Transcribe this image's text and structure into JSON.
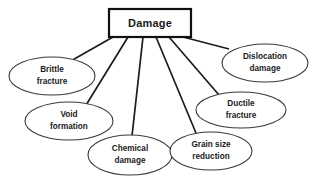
{
  "diagram": {
    "type": "radial-tree",
    "title": "Damage",
    "canvas": {
      "width": 316,
      "height": 182,
      "background": "#ffffff"
    },
    "colors": {
      "root_border": "#111111",
      "leaf_border": "#3a3a3a",
      "connector": "#1c1c1c",
      "text": "#1a1a1a",
      "fill": "#ffffff"
    },
    "root": {
      "label": "Damage",
      "shape": "rectangle",
      "x": 109,
      "y": 9,
      "width": 82,
      "height": 28
    },
    "leaves": [
      {
        "id": "brittle-fracture",
        "line1": "Brittle",
        "line2": "fracture",
        "shape": "ellipse",
        "cx": 52,
        "cy": 76,
        "rx": 43,
        "ry": 19,
        "connector": {
          "x1": 113,
          "y1": 37,
          "x2": 69,
          "y2": 62
        }
      },
      {
        "id": "void-formation",
        "line1": "Void",
        "line2": "formation",
        "shape": "ellipse",
        "cx": 69,
        "cy": 121,
        "rx": 44,
        "ry": 19,
        "connector": {
          "x1": 128,
          "y1": 37,
          "x2": 83,
          "y2": 110
        }
      },
      {
        "id": "chemical-damage",
        "line1": "Chemical",
        "line2": "damage",
        "shape": "ellipse",
        "cx": 130,
        "cy": 155,
        "rx": 42,
        "ry": 20,
        "connector": {
          "x1": 143,
          "y1": 37,
          "x2": 132,
          "y2": 136
        }
      },
      {
        "id": "grain-size-reduction",
        "line1": "Grain size",
        "line2": "reduction",
        "shape": "ellipse",
        "cx": 211,
        "cy": 151,
        "rx": 41,
        "ry": 19,
        "connector": {
          "x1": 156,
          "y1": 37,
          "x2": 196,
          "y2": 133
        }
      },
      {
        "id": "ductile-fracture",
        "line1": "Ductile",
        "line2": "fracture",
        "shape": "ellipse",
        "cx": 241,
        "cy": 110,
        "rx": 45,
        "ry": 18,
        "connector": {
          "x1": 169,
          "y1": 37,
          "x2": 219,
          "y2": 95
        }
      },
      {
        "id": "dislocation-damage",
        "line1": "Dislocation",
        "line2": "damage",
        "shape": "ellipse",
        "cx": 265,
        "cy": 63,
        "rx": 43,
        "ry": 19,
        "connector": {
          "x1": 183,
          "y1": 37,
          "x2": 229,
          "y2": 49
        }
      }
    ]
  }
}
